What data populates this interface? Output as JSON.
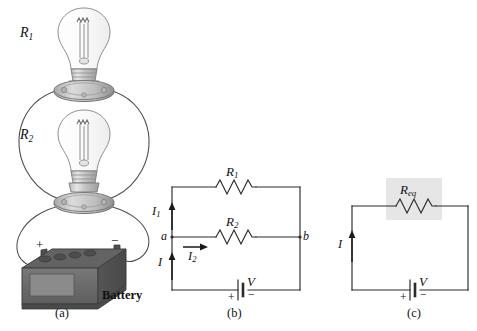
{
  "figure": {
    "panels": [
      {
        "id": "a",
        "caption": "(a)",
        "type": "pictorial",
        "labels": {
          "bulb_top": "R",
          "bulb_top_sub": "1",
          "bulb_bottom": "R",
          "bulb_bottom_sub": "2",
          "battery": "Battery",
          "terminal_positive": "+",
          "terminal_negative": "−"
        }
      },
      {
        "id": "b",
        "caption": "(b)",
        "type": "schematic",
        "labels": {
          "resistor_top": "R",
          "resistor_top_sub": "1",
          "resistor_mid": "R",
          "resistor_mid_sub": "2",
          "node_left": "a",
          "node_right": "b",
          "current_branch1": "I",
          "current_branch1_sub": "1",
          "current_branch2": "I",
          "current_branch2_sub": "2",
          "current_total": "I",
          "source_voltage": "V",
          "source_positive": "+",
          "source_negative": "−"
        }
      },
      {
        "id": "c",
        "caption": "(c)",
        "type": "schematic",
        "labels": {
          "resistor_eq": "R",
          "resistor_eq_sub": "eq",
          "current_total": "I",
          "source_voltage": "V",
          "source_positive": "+",
          "source_negative": "−"
        }
      }
    ]
  },
  "colors": {
    "wire": "#2b2b2b",
    "highlight_box": "#e6e6e6",
    "battery_body": "#6e6e6e",
    "battery_top": "#575757",
    "battery_panel": "#838383",
    "bulb_glass": "#fdfdfd",
    "bulb_outline": "#8a8a8a",
    "socket_light": "#cfcfcf",
    "socket_dark": "#9a9a9a",
    "background": "#ffffff"
  }
}
